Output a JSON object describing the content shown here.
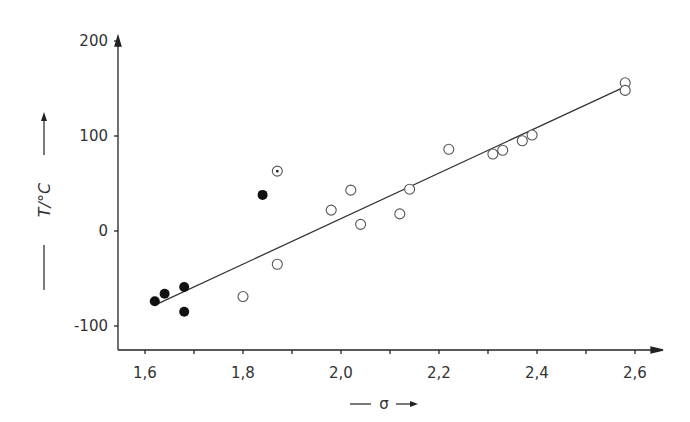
{
  "chart_data": {
    "type": "scatter",
    "title": "",
    "xlabel": "σ",
    "ylabel": "T/°C",
    "xlim": [
      1.55,
      2.65
    ],
    "ylim": [
      -120,
      210
    ],
    "grid": false,
    "x_ticks": [
      "1,6",
      "1,8",
      "2,0",
      "2,2",
      "2,4",
      "2,6"
    ],
    "x_tick_values": [
      1.6,
      1.8,
      2.0,
      2.2,
      2.4,
      2.6
    ],
    "y_ticks": [
      "200",
      "100",
      "0",
      "-100"
    ],
    "y_tick_values": [
      200,
      100,
      0,
      -100
    ],
    "series": [
      {
        "name": "filled",
        "marker": "filled-circle",
        "points": [
          [
            1.62,
            -74
          ],
          [
            1.64,
            -66
          ],
          [
            1.68,
            -59
          ],
          [
            1.68,
            -85
          ],
          [
            1.84,
            38
          ]
        ]
      },
      {
        "name": "dotted",
        "marker": "dotted-circle",
        "points": [
          [
            1.87,
            63
          ]
        ]
      },
      {
        "name": "open",
        "marker": "open-circle",
        "points": [
          [
            1.8,
            -69
          ],
          [
            1.87,
            -35
          ],
          [
            1.98,
            22
          ],
          [
            2.02,
            43
          ],
          [
            2.04,
            7
          ],
          [
            2.12,
            18
          ],
          [
            2.14,
            44
          ],
          [
            2.22,
            86
          ],
          [
            2.31,
            81
          ],
          [
            2.33,
            85
          ],
          [
            2.37,
            95
          ],
          [
            2.39,
            101
          ],
          [
            2.58,
            156
          ],
          [
            2.58,
            148
          ]
        ]
      }
    ],
    "fit_line": {
      "x": [
        1.62,
        2.58
      ],
      "y": [
        -78,
        152
      ]
    }
  }
}
